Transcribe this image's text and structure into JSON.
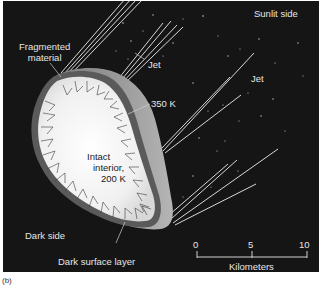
{
  "figure": {
    "panel_label": "(b)",
    "labels": {
      "fragmented_material": "Fragmented\nmaterial",
      "jet_1": "Jet",
      "jet_2": "Jet",
      "sunlit_side": "Sunlit side",
      "temp_surface": "350 K",
      "interior_line1": "Intact",
      "interior_line2": "interior,",
      "interior_line3": "200 K",
      "dark_side": "Dark side",
      "dark_surface_layer": "Dark surface layer"
    },
    "scale_bar": {
      "ticks": [
        "0",
        "5",
        "10"
      ],
      "unit": "Kilometers"
    },
    "colors": {
      "background": "#151515",
      "interior": "#f2f2f2",
      "crust": "#7a7a7a",
      "sunlit_crust": "#9a9a9a",
      "jets": "#d8d8d8",
      "text": "#e6e6e6"
    }
  }
}
